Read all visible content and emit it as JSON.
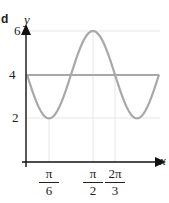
{
  "part_label": "d",
  "chart_data": {
    "type": "line",
    "title": "",
    "xlabel": "x",
    "ylabel": "y",
    "xlim": [
      0,
      3.1416
    ],
    "ylim": [
      0,
      6
    ],
    "grid": true,
    "x_ticks": [
      {
        "value": 0.5236,
        "num": "π",
        "den": "6"
      },
      {
        "value": 1.5708,
        "num": "π",
        "den": "2"
      },
      {
        "value": 2.0944,
        "num": "2π",
        "den": "3"
      }
    ],
    "y_ticks": [
      {
        "value": 2,
        "label": "2"
      },
      {
        "value": 4,
        "label": "4"
      },
      {
        "value": 6,
        "label": "6"
      }
    ],
    "series": [
      {
        "name": "y = 4 - 2 sin 3x",
        "color": "#a8a8a8",
        "x": [
          0,
          0.5236,
          1.0472,
          1.5708,
          2.0944,
          2.618,
          3.1416
        ],
        "y": [
          4,
          2,
          4,
          6,
          4,
          2,
          4
        ]
      },
      {
        "name": "y = 4",
        "color": "#a8a8a8",
        "x": [
          0,
          3.1416
        ],
        "y": [
          4,
          4
        ]
      }
    ]
  },
  "axis_labels": {
    "x": "x",
    "y": "y"
  },
  "y_tick_labels": {
    "six": "6",
    "four": "4",
    "two": "2"
  },
  "x_tick_labels": {
    "pi6": {
      "num": "π",
      "den": "6"
    },
    "pi2": {
      "num": "π",
      "den": "2"
    },
    "twopi3": {
      "num": "2π",
      "den": "3"
    }
  }
}
